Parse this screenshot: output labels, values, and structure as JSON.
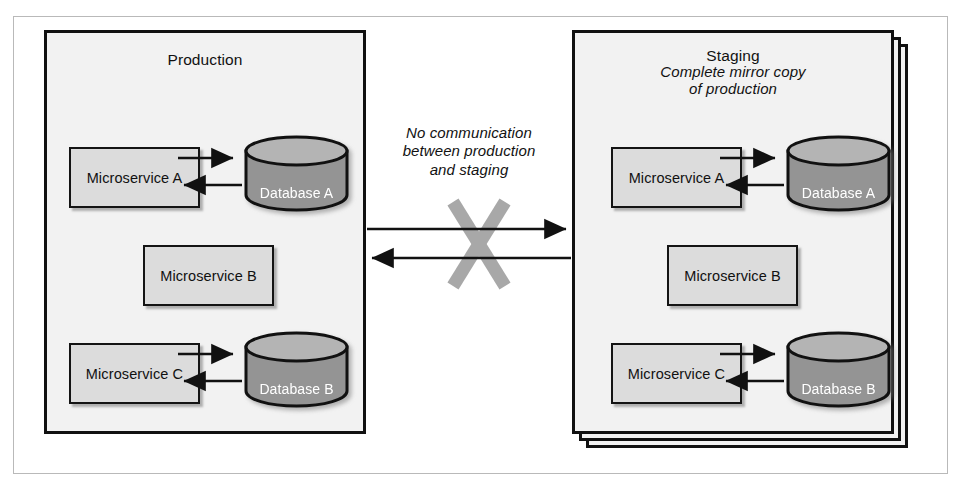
{
  "figure": {
    "colors": {
      "panel_fill": "#f2f2f2",
      "panel_border": "#111111",
      "service_fill": "#dcdcdc",
      "service_border": "#141414",
      "database_body": "#949494",
      "database_top": "#b4b4b4",
      "database_border": "#111111",
      "database_label": "#ffffff",
      "arrow": "#111111",
      "cross_mark": "#a8a8a8",
      "outer_frame": "#b9b9b9",
      "page_background": "#ffffff"
    }
  },
  "environments": [
    {
      "id": "production",
      "title": "Production",
      "subtitle_lines": [],
      "stacked": false,
      "services": [
        {
          "id": "prod-ms-a",
          "label": "Microservice A"
        },
        {
          "id": "prod-ms-b",
          "label": "Microservice B"
        },
        {
          "id": "prod-ms-c",
          "label": "Microservice C"
        }
      ],
      "databases": [
        {
          "id": "prod-db-a",
          "label": "Database A"
        },
        {
          "id": "prod-db-b",
          "label": "Database B"
        }
      ],
      "internal_links": [
        {
          "from": "Microservice A",
          "to": "Database A",
          "direction": "bidirectional"
        },
        {
          "from": "Microservice C",
          "to": "Database B",
          "direction": "bidirectional"
        }
      ]
    },
    {
      "id": "staging",
      "title": "Staging",
      "subtitle_lines": [
        "Complete mirror copy",
        "of production"
      ],
      "stacked": true,
      "services": [
        {
          "id": "stag-ms-a",
          "label": "Microservice A"
        },
        {
          "id": "stag-ms-b",
          "label": "Microservice B"
        },
        {
          "id": "stag-ms-c",
          "label": "Microservice C"
        }
      ],
      "databases": [
        {
          "id": "stag-db-a",
          "label": "Database A"
        },
        {
          "id": "stag-db-b",
          "label": "Database B"
        }
      ],
      "internal_links": [
        {
          "from": "Microservice A",
          "to": "Database A",
          "direction": "bidirectional"
        },
        {
          "from": "Microservice C",
          "to": "Database B",
          "direction": "bidirectional"
        }
      ]
    }
  ],
  "center_annotation": {
    "lines": [
      "No communication",
      "between production",
      "and staging"
    ],
    "text": "No communication between production and staging",
    "marker": "cross-out-x"
  },
  "cross_links": [
    {
      "id": "prod-to-staging",
      "from": "production",
      "to": "staging",
      "direction": "right",
      "blocked": true
    },
    {
      "id": "staging-to-prod",
      "from": "staging",
      "to": "production",
      "direction": "left",
      "blocked": true
    }
  ]
}
